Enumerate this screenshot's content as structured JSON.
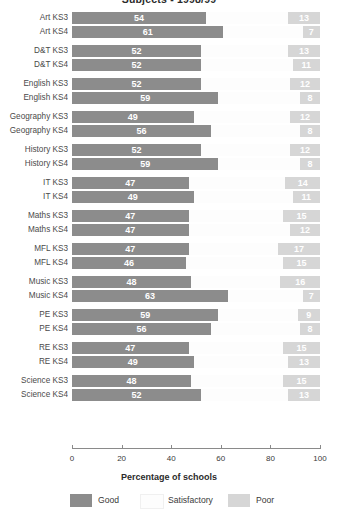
{
  "chart_data": {
    "type": "bar",
    "title": "Subjects - 1998/99",
    "xlabel": "Percentage of schools",
    "ylabel": "",
    "xlim": [
      0,
      100
    ],
    "xticks": [
      "0",
      "20",
      "40",
      "60",
      "80",
      "100"
    ],
    "grid": false,
    "orientation": "horizontal",
    "stacked": true,
    "legend_position": "bottom",
    "legend": [
      "Good",
      "Satisfactory",
      "Poor"
    ],
    "colors": {
      "good": "#8c8c8c",
      "satisfactory": "#fdfdfd",
      "poor": "#d6d6d6"
    },
    "categories": [
      "Art KS3",
      "Art KS4",
      "D&T KS3",
      "D&T KS4",
      "English KS3",
      "English KS4",
      "Geography KS3",
      "Geography KS4",
      "History KS3",
      "History KS4",
      "IT KS3",
      "IT KS4",
      "Maths KS3",
      "Maths KS4",
      "MFL KS3",
      "MFL KS4",
      "Music KS3",
      "Music KS4",
      "PE KS3",
      "PE KS4",
      "RE KS3",
      "RE KS4",
      "Science KS3",
      "Science KS4"
    ],
    "series": [
      {
        "name": "Good",
        "values": [
          54,
          61,
          52,
          52,
          52,
          59,
          49,
          56,
          52,
          59,
          47,
          49,
          47,
          47,
          47,
          46,
          48,
          63,
          59,
          56,
          47,
          49,
          48,
          52
        ]
      },
      {
        "name": "Poor",
        "values": [
          13,
          7,
          13,
          11,
          12,
          8,
          12,
          8,
          12,
          8,
          14,
          11,
          15,
          12,
          17,
          15,
          16,
          7,
          9,
          8,
          15,
          13,
          15,
          13
        ]
      }
    ],
    "groups": [
      {
        "subject": "Art",
        "rows": [
          {
            "label": "Art KS3",
            "good": 54,
            "poor": 13
          },
          {
            "label": "Art KS4",
            "good": 61,
            "poor": 7
          }
        ]
      },
      {
        "subject": "D&T",
        "rows": [
          {
            "label": "D&T KS3",
            "good": 52,
            "poor": 13
          },
          {
            "label": "D&T KS4",
            "good": 52,
            "poor": 11
          }
        ]
      },
      {
        "subject": "English",
        "rows": [
          {
            "label": "English KS3",
            "good": 52,
            "poor": 12
          },
          {
            "label": "English KS4",
            "good": 59,
            "poor": 8
          }
        ]
      },
      {
        "subject": "Geography",
        "rows": [
          {
            "label": "Geography KS3",
            "good": 49,
            "poor": 12
          },
          {
            "label": "Geography KS4",
            "good": 56,
            "poor": 8
          }
        ]
      },
      {
        "subject": "History",
        "rows": [
          {
            "label": "History KS3",
            "good": 52,
            "poor": 12
          },
          {
            "label": "History KS4",
            "good": 59,
            "poor": 8
          }
        ]
      },
      {
        "subject": "IT",
        "rows": [
          {
            "label": "IT KS3",
            "good": 47,
            "poor": 14
          },
          {
            "label": "IT KS4",
            "good": 49,
            "poor": 11
          }
        ]
      },
      {
        "subject": "Maths",
        "rows": [
          {
            "label": "Maths KS3",
            "good": 47,
            "poor": 15
          },
          {
            "label": "Maths KS4",
            "good": 47,
            "poor": 12
          }
        ]
      },
      {
        "subject": "MFL",
        "rows": [
          {
            "label": "MFL KS3",
            "good": 47,
            "poor": 17
          },
          {
            "label": "MFL KS4",
            "good": 46,
            "poor": 15
          }
        ]
      },
      {
        "subject": "Music",
        "rows": [
          {
            "label": "Music KS3",
            "good": 48,
            "poor": 16
          },
          {
            "label": "Music KS4",
            "good": 63,
            "poor": 7
          }
        ]
      },
      {
        "subject": "PE",
        "rows": [
          {
            "label": "PE KS3",
            "good": 59,
            "poor": 9
          },
          {
            "label": "PE KS4",
            "good": 56,
            "poor": 8
          }
        ]
      },
      {
        "subject": "RE",
        "rows": [
          {
            "label": "RE KS3",
            "good": 47,
            "poor": 15
          },
          {
            "label": "RE KS4",
            "good": 49,
            "poor": 13
          }
        ]
      },
      {
        "subject": "Science",
        "rows": [
          {
            "label": "Science KS3",
            "good": 48,
            "poor": 15
          },
          {
            "label": "Science KS4",
            "good": 52,
            "poor": 13
          }
        ]
      }
    ]
  }
}
